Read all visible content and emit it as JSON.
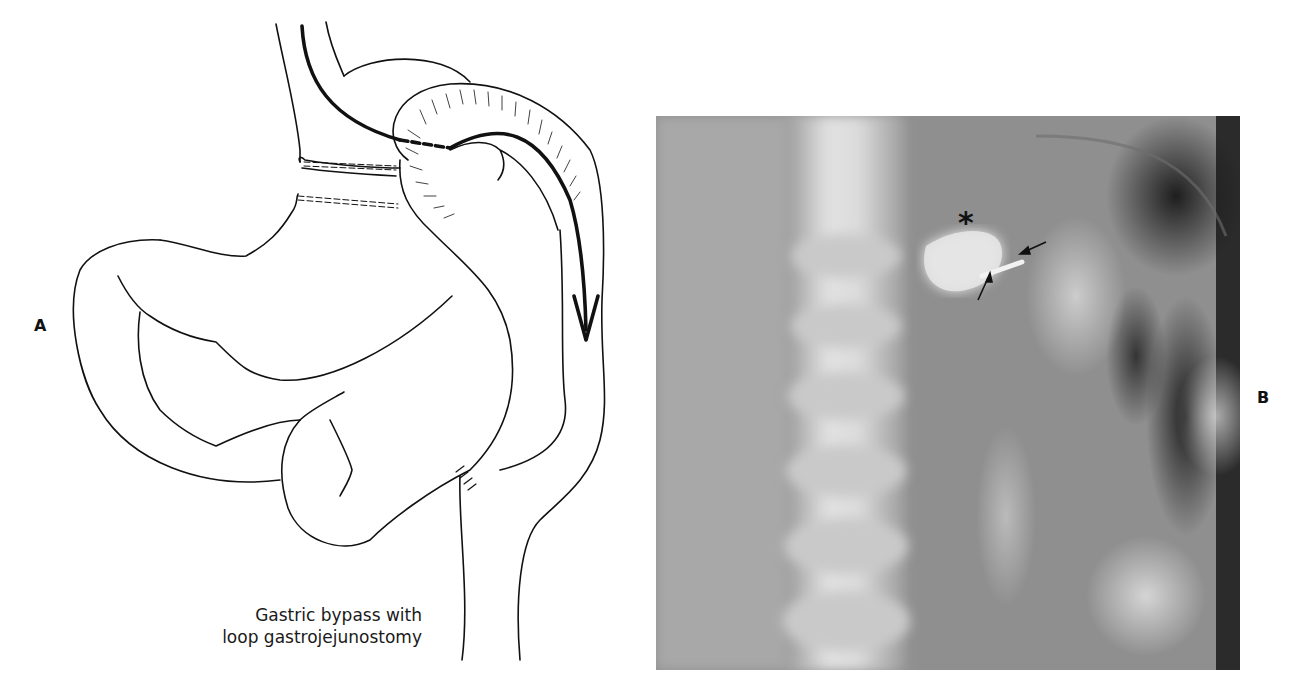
{
  "figure": {
    "panel_a": {
      "label": "A",
      "caption_lines": [
        "Gastric bypass with",
        "loop gastrojejunostomy"
      ]
    },
    "panel_b": {
      "label": "B",
      "annotation_asterisk": "*",
      "arrow_count": 2
    }
  },
  "colors": {
    "ink": "#111111",
    "background": "#ffffff",
    "xray_mid": "#8a8a8a",
    "xray_bright": "#e6e6e6",
    "xray_dark": "#1e1e1e"
  }
}
